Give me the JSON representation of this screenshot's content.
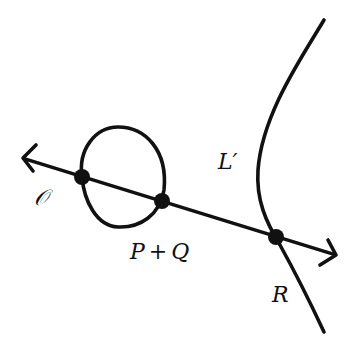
{
  "diagram": {
    "stroke_color": "#111111",
    "background": "#ffffff",
    "line": {
      "name": "secant-line",
      "from": [
        22,
        158
      ],
      "to": [
        336,
        255
      ],
      "arrows": "both"
    },
    "loop_component": {
      "name": "oval-component",
      "top": [
        118,
        127
      ],
      "left": [
        83,
        172
      ],
      "right": [
        167,
        180
      ],
      "bottom": [
        118,
        227
      ]
    },
    "unbounded_component": {
      "name": "curve-branch",
      "top": [
        324,
        20
      ],
      "vertex": [
        258,
        178
      ],
      "bottom": [
        324,
        332
      ]
    },
    "points": [
      {
        "id": "O",
        "x": 82,
        "y": 177
      },
      {
        "id": "P+Q",
        "x": 162,
        "y": 201
      },
      {
        "id": "R",
        "x": 276,
        "y": 237
      }
    ],
    "labels": {
      "origin": "𝒪",
      "sum_p": "P",
      "sum_plus": "+",
      "sum_q": "Q",
      "curve": "L′",
      "r": "R"
    }
  }
}
